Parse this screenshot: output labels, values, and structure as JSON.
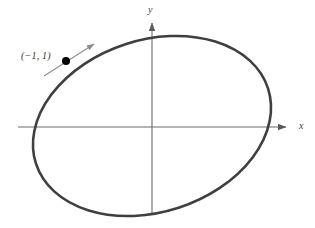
{
  "figure": {
    "background_color": "#ffffff",
    "width": 315,
    "height": 228,
    "curve_color": "#3f3f3f",
    "axis_color": "#6b6b6b",
    "point_color": "#000000",
    "tangent_color": "#8c8c8c",
    "label_color": "#333333"
  },
  "axes": {
    "x_label": "x",
    "y_label": "y",
    "origin": {
      "x": 152,
      "y": 127
    },
    "x_axis": {
      "start_x": 18,
      "end_x": 292,
      "y": 127,
      "arrow": "right"
    },
    "y_axis": {
      "top_y": 17,
      "bottom_y": 215,
      "x": 152,
      "arrow": "up"
    }
  },
  "annotations": {
    "point_label": "(−1, 1)",
    "point_label_plain": "(-1, 1)",
    "point_marker_name": "point-on-curve",
    "tangent_name": "tangent-arrow"
  },
  "chart_data": {
    "type": "scatter",
    "title": "",
    "subtitle": "",
    "xlabel": "x",
    "ylabel": "y",
    "grid": false,
    "legend": null,
    "curves": [
      {
        "name": "rotated-ellipse",
        "kind": "ellipse",
        "center_px": {
          "x": 152,
          "y": 126
        },
        "radius_x_px": 122,
        "radius_y_px": 86,
        "rotation_deg": -18,
        "stroke": "#3f3f3f",
        "stroke_width": 2.6,
        "fill": "none",
        "extent_px": {
          "left": 38,
          "right": 266,
          "top": 48,
          "bottom": 203
        }
      }
    ],
    "points": [
      {
        "label": "(−1, 1)",
        "x": -1,
        "y": 1,
        "px": {
          "x": 66,
          "y": 61
        },
        "radius_px": 4,
        "color": "#000000"
      }
    ],
    "annotations": [
      {
        "name": "tangent-line",
        "kind": "arrow",
        "from_px": {
          "x": 44,
          "y": 76
        },
        "to_px": {
          "x": 94,
          "y": 44
        },
        "color": "#8c8c8c",
        "stroke_width": 1.1,
        "arrowhead": "end"
      }
    ],
    "axis_ranges": {
      "x_px": [
        18,
        292
      ],
      "y_px": [
        17,
        215
      ]
    }
  }
}
